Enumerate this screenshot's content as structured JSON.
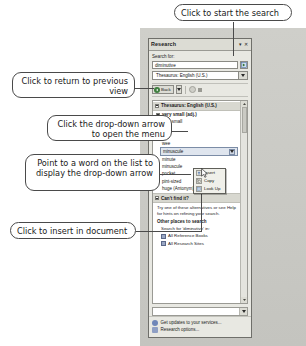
{
  "pane": {
    "title": "Research",
    "title_buttons": [
      "dropdown",
      "close"
    ],
    "search_label": "Search for:",
    "search_value": "diminutive",
    "search_placeholder": "Search for:",
    "go_button_name": "start-search",
    "source_select": "Thesaurus: English (U.S.)",
    "toolbar": {
      "back_label": "Back",
      "forward_name": "forward-button",
      "stop_name": "stop-button"
    },
    "results": {
      "header": "Thesaurus: English (U.S.)",
      "group": "very small (adj.)",
      "items": [
        "very small",
        "little",
        "tiny",
        "wee",
        "minuscule",
        "minute",
        "minuscule",
        "pocket",
        "pint-sized",
        "huge (Antonym)"
      ],
      "selected": "minuscule",
      "selected_index": 4
    },
    "cant_find": {
      "header": "Can't find it?",
      "body": "Try one of these alternatives or see Help for hints on refining your search.",
      "other_places_header": "Other places to search",
      "search_in_label": "Search for 'diminutive' in:",
      "links": [
        "All Reference Books",
        "All Research Sites"
      ]
    },
    "footer": {
      "updates": "Get updates to your services...",
      "options": "Research options..."
    }
  },
  "context_menu": {
    "items": [
      "Insert",
      "Copy",
      "Look Up"
    ]
  },
  "callouts": {
    "start_search": "Click to start the search",
    "previous_view": "Click to return to previous view",
    "open_menu": "Click the drop-down arrow to open the menu",
    "point_word": "Point to a word on the list to display the drop-down arrow",
    "insert_doc": "Click to insert in document"
  },
  "colors": {
    "pane_bg": "#e8e8e2",
    "selection": "#dfe5ee",
    "back_green": "#3f7f3f",
    "doc_bg": "#c9c9c4"
  }
}
